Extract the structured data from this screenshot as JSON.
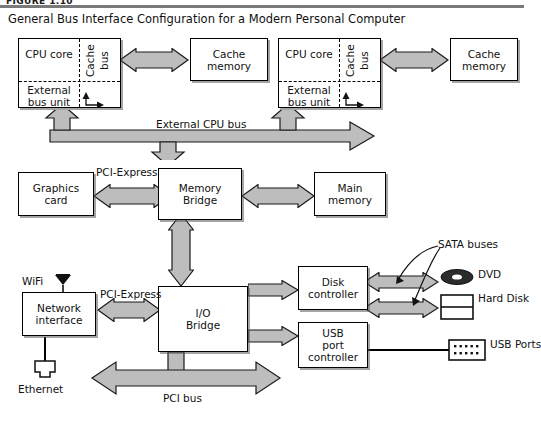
{
  "figure": {
    "label": "FIGURE 1.10",
    "title": "General Bus Interface Configuration for a Modern Personal Computer"
  },
  "colors": {
    "bus_fill": "#bdbdbd",
    "outline": "#1a1a1a",
    "box_fill": "#ffffff",
    "rule": "#7a7a7a"
  },
  "cpus": [
    {
      "core_label": "CPU\ncore",
      "core_label_line1": "CPU",
      "core_label_line2": "core",
      "cache_bus_label": "Cache\nbus",
      "cache_bus_line1": "Cache",
      "cache_bus_line2": "bus",
      "external_bus_unit_line1": "External",
      "external_bus_unit_line2": "bus unit",
      "cache_memory_line1": "Cache",
      "cache_memory_line2": "memory"
    },
    {
      "core_label": "CPU\ncore",
      "core_label_line1": "CPU",
      "core_label_line2": "core",
      "cache_bus_label": "Cache\nbus",
      "cache_bus_line1": "Cache",
      "cache_bus_line2": "bus",
      "external_bus_unit_line1": "External",
      "external_bus_unit_line2": "bus unit",
      "cache_memory_line1": "Cache",
      "cache_memory_line2": "memory"
    }
  ],
  "buses": {
    "external_cpu_bus": "External CPU bus",
    "pci_express_graphics": "PCI-Express",
    "pci_express_network": "PCI-Express",
    "pci_bus": "PCI bus",
    "sata_buses": "SATA buses"
  },
  "blocks": {
    "graphics_card_line1": "Graphics",
    "graphics_card_line2": "card",
    "memory_bridge_line1": "Memory",
    "memory_bridge_line2": "Bridge",
    "main_memory_line1": "Main",
    "main_memory_line2": "memory",
    "network_interface_line1": "Network",
    "network_interface_line2": "interface",
    "io_bridge_line1": "I/O",
    "io_bridge_line2": "Bridge",
    "disk_controller_line1": "Disk",
    "disk_controller_line2": "controller",
    "usb_controller_line1": "USB",
    "usb_controller_line2": "port",
    "usb_controller_line3": "controller"
  },
  "peripherals": {
    "wifi": "WiFi",
    "ethernet": "Ethernet",
    "dvd": "DVD",
    "hard_disk_line1": "Hard",
    "hard_disk_line2": "Disk",
    "usb_ports_line1": "USB",
    "usb_ports_line2": "Ports"
  }
}
